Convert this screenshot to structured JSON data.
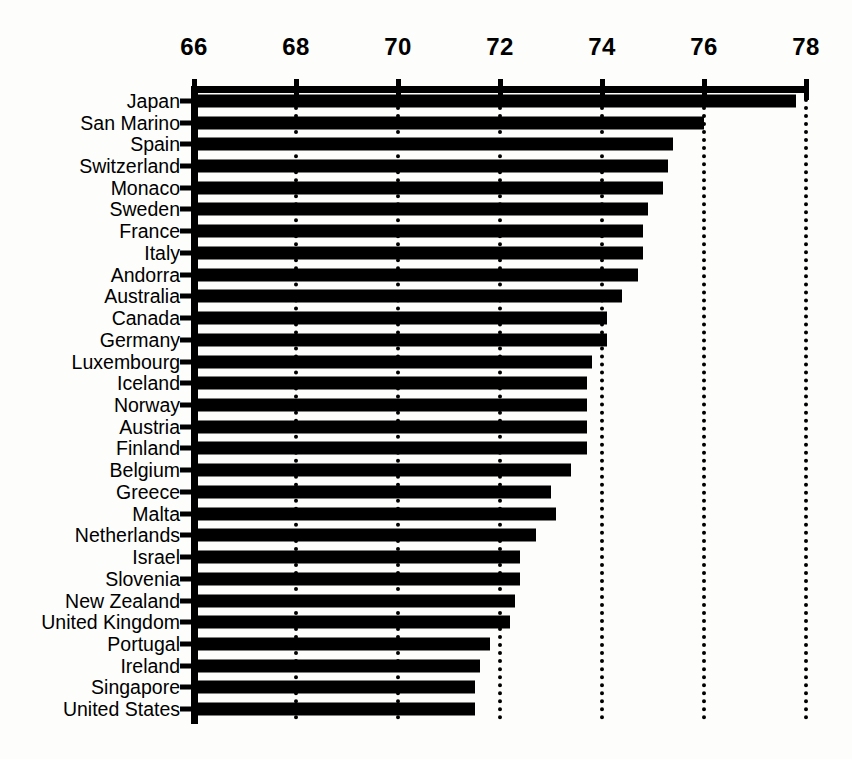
{
  "chart_data": {
    "type": "bar",
    "orientation": "horizontal",
    "title": "",
    "subtitle": "",
    "xlabel": "",
    "ylabel": "",
    "xlim": [
      66,
      78
    ],
    "ylim": null,
    "grid": true,
    "grid_style": "dotted vertical gridlines at even tick values",
    "legend": null,
    "legend_position": "none",
    "bar_color": "#000000",
    "background_color": "#fdfdfb",
    "xticks": [
      66,
      68,
      70,
      72,
      74,
      76,
      78
    ],
    "xticklabels": [
      "66",
      "68",
      "70",
      "72",
      "74",
      "76",
      "78"
    ],
    "categories": [
      "Japan",
      "San Marino",
      "Spain",
      "Switzerland",
      "Monaco",
      "Sweden",
      "France",
      "Italy",
      "Andorra",
      "Australia",
      "Canada",
      "Germany",
      "Luxembourg",
      "Iceland",
      "Norway",
      "Austria",
      "Finland",
      "Belgium",
      "Greece",
      "Malta",
      "Netherlands",
      "Israel",
      "Slovenia",
      "New Zealand",
      "United Kingdom",
      "Portugal",
      "Ireland",
      "Singapore",
      "United States"
    ],
    "values": [
      77.8,
      76.0,
      75.4,
      75.3,
      75.2,
      74.9,
      74.8,
      74.8,
      74.7,
      74.4,
      74.1,
      74.1,
      73.8,
      73.7,
      73.7,
      73.7,
      73.7,
      73.4,
      73.0,
      73.1,
      72.7,
      72.4,
      72.4,
      72.3,
      72.2,
      71.8,
      71.6,
      71.5,
      71.5
    ]
  }
}
